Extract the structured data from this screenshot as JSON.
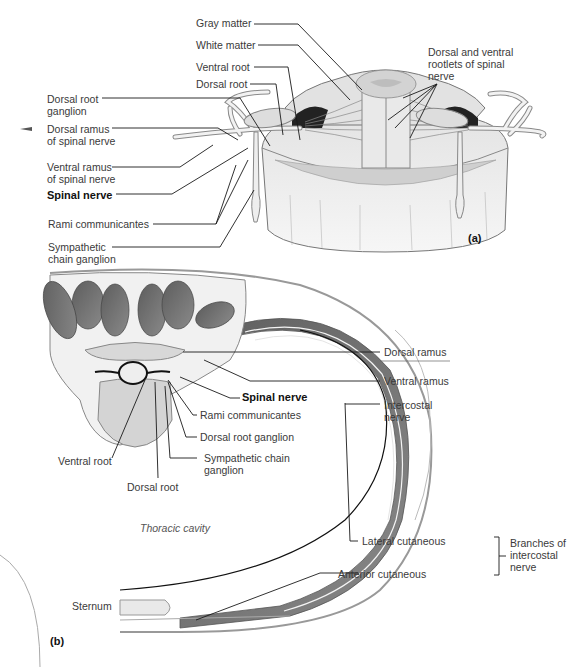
{
  "figure": {
    "panel_a": {
      "tag": "(a)",
      "labels": {
        "gray_matter": "Gray matter",
        "white_matter": "White matter",
        "ventral_root": "Ventral root",
        "dorsal_root": "Dorsal root",
        "dorsal_root_ganglion_1": "Dorsal root",
        "dorsal_root_ganglion_2": "ganglion",
        "dorsal_ramus_1": "Dorsal ramus",
        "dorsal_ramus_2": "of spinal nerve",
        "ventral_ramus_1": "Ventral ramus",
        "ventral_ramus_2": "of spinal nerve",
        "spinal_nerve": "Spinal nerve",
        "rami_communicantes": "Rami communicantes",
        "sympathetic_1": "Sympathetic",
        "sympathetic_2": "chain ganglion",
        "rootlets_1": "Dorsal and ventral",
        "rootlets_2": "rootlets of spinal",
        "rootlets_3": "nerve"
      }
    },
    "panel_b": {
      "tag": "(b)",
      "labels": {
        "dorsal_ramus": "Dorsal ramus",
        "ventral_ramus": "Ventral ramus",
        "intercostal_1": "Intercostal",
        "intercostal_2": "nerve",
        "spinal_nerve": "Spinal nerve",
        "rami_communicantes": "Rami communicantes",
        "dorsal_root_ganglion": "Dorsal root  ganglion",
        "sympathetic_1": "Sympathetic chain",
        "sympathetic_2": "ganglion",
        "ventral_root": "Ventral root",
        "dorsal_root": "Dorsal root",
        "thoracic_cavity": "Thoracic cavity",
        "lateral_cutaneous": "Lateral cutaneous",
        "anterior_cutaneous": "Anterior cutaneous",
        "branches_1": "Branches of",
        "branches_2": "intercostal",
        "branches_3": "nerve",
        "sternum": "Sternum"
      }
    },
    "colors": {
      "ink": "#1a1a1a",
      "muscle": "#6e6e6e",
      "bone": "#d9d9d9",
      "light": "#ececec"
    }
  }
}
